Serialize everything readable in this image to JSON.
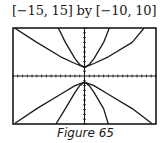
{
  "window_label": "[−15, 15] by [−10, 10]",
  "caption": "Figure 65",
  "colors": {
    "ink": "#1a1a1a",
    "background": "#ffffff"
  },
  "chart_data": {
    "type": "line",
    "title": "[−15, 15] by [−10, 10]",
    "caption": "Figure 65",
    "xlabel": "",
    "ylabel": "",
    "xlim": [
      -15,
      15
    ],
    "ylim": [
      -10,
      10
    ],
    "grid": false,
    "axes_ticks": "unit tick marks along both axes",
    "legend": null,
    "series": [
      {
        "name": "upper-shallow-left",
        "points": [
          [
            -15,
            10.2
          ],
          [
            -10,
            7.0
          ],
          [
            -5,
            4.0
          ],
          [
            -2,
            2.6
          ],
          [
            0,
            1.8
          ]
        ]
      },
      {
        "name": "upper-steep-left",
        "points": [
          [
            -5.5,
            10.0
          ],
          [
            -4,
            7.0
          ],
          [
            -2,
            3.6
          ],
          [
            -1,
            2.4
          ],
          [
            0,
            1.8
          ]
        ]
      },
      {
        "name": "upper-steep-right",
        "points": [
          [
            0,
            1.8
          ],
          [
            1,
            2.4
          ],
          [
            2,
            3.6
          ],
          [
            4,
            7.0
          ],
          [
            5.2,
            10.0
          ]
        ]
      },
      {
        "name": "upper-shallow-right",
        "points": [
          [
            0,
            1.8
          ],
          [
            2,
            2.6
          ],
          [
            5,
            4.0
          ],
          [
            10,
            7.0
          ],
          [
            12.5,
            10.0
          ]
        ]
      },
      {
        "name": "lower-shallow-left",
        "points": [
          [
            -14.5,
            -9.8
          ],
          [
            -10,
            -6.8
          ],
          [
            -5,
            -3.8
          ],
          [
            -2,
            -2.0
          ],
          [
            0,
            -1.3
          ]
        ]
      },
      {
        "name": "lower-steep-left",
        "points": [
          [
            -6,
            -10.0
          ],
          [
            -4,
            -6.8
          ],
          [
            -2,
            -3.4
          ],
          [
            -1,
            -2.0
          ],
          [
            0,
            -1.3
          ]
        ]
      },
      {
        "name": "lower-steep-right",
        "points": [
          [
            0,
            -1.3
          ],
          [
            1,
            -2.0
          ],
          [
            2,
            -3.4
          ],
          [
            4,
            -6.8
          ],
          [
            5.0,
            -10.0
          ]
        ]
      },
      {
        "name": "lower-shallow-right",
        "points": [
          [
            0,
            -1.3
          ],
          [
            2,
            -2.0
          ],
          [
            5,
            -3.8
          ],
          [
            10,
            -6.8
          ],
          [
            14,
            -9.8
          ]
        ]
      }
    ]
  }
}
